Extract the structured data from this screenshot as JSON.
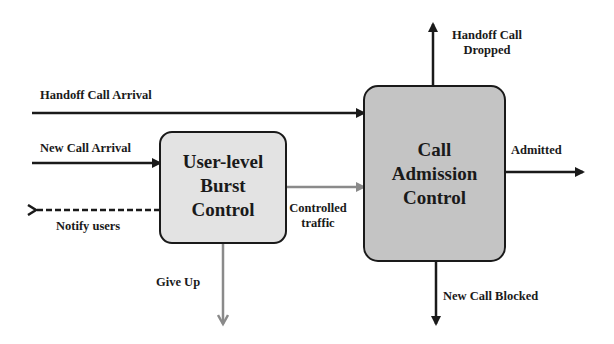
{
  "blocks": {
    "burst_control": {
      "lines": [
        "User-level",
        "Burst",
        "Control"
      ],
      "fill": "#e3e3e3"
    },
    "cac": {
      "lines": [
        "Call",
        "Admission",
        "Control"
      ],
      "fill": "#c4c4c4"
    }
  },
  "labels": {
    "handoff_arrival": "Handoff Call Arrival",
    "new_arrival": "New Call Arrival",
    "notify_users": "Notify users",
    "give_up": "Give Up",
    "controlled_traffic_1": "Controlled",
    "controlled_traffic_2": "traffic",
    "handoff_dropped_1": "Handoff Call",
    "handoff_dropped_2": "Dropped",
    "admitted": "Admitted",
    "new_blocked": "New Call Blocked"
  },
  "colors": {
    "line_dark": "#1a1a1a",
    "line_gray": "#8a8a8a"
  }
}
